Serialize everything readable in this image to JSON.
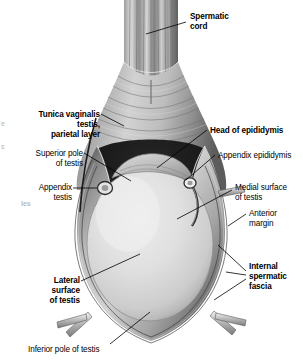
{
  "figure": {
    "background_color": "#ffffff",
    "ink_color": "#000000"
  },
  "labels": [
    {
      "id": "spermatic-cord",
      "text": "Spermatic\ncord",
      "weight": "bold",
      "align": "left",
      "x": 190,
      "y": 12
    },
    {
      "id": "tunica-vaginalis-testis-parietal-layer",
      "text": "Tunica vaginalis\ntestis,\nparietal layer",
      "weight": "bold",
      "align": "right",
      "x": 8,
      "y": 110
    },
    {
      "id": "head-of-epididymis",
      "text": "Head of epididymis",
      "weight": "bold",
      "align": "left",
      "x": 210,
      "y": 126
    },
    {
      "id": "superior-pole-of-testis",
      "text": "Superior pole\nof testis",
      "weight": "normal",
      "align": "right",
      "x": 11,
      "y": 149
    },
    {
      "id": "appendix-epididymis",
      "text": "Appendix epididymis",
      "weight": "normal",
      "align": "left",
      "x": 218,
      "y": 151
    },
    {
      "id": "medial-surface-of-testis",
      "text": "Medial surface\nof testis",
      "weight": "normal",
      "align": "left",
      "x": 235,
      "y": 183
    },
    {
      "id": "appendix-testis",
      "text": "Appendix\ntestis",
      "weight": "normal",
      "align": "right",
      "x": 22,
      "y": 183
    },
    {
      "id": "anterior-margin",
      "text": "Anterior\nmargin",
      "weight": "normal",
      "align": "left",
      "x": 249,
      "y": 209
    },
    {
      "id": "lateral-surface-of-testis",
      "text": "Lateral\nsurface\nof testis",
      "weight": "bold",
      "align": "right",
      "x": 18,
      "y": 276
    },
    {
      "id": "internal-spermatic-fascia",
      "text": "Internal\nspermatic\nfascia",
      "weight": "bold",
      "align": "left",
      "x": 249,
      "y": 262
    },
    {
      "id": "inferior-pole-of-testis",
      "text": "Inferior pole of testis",
      "weight": "normal",
      "align": "left",
      "x": 28,
      "y": 345
    }
  ],
  "artifacts": [
    {
      "id": "margin-artifact-1",
      "text": "e",
      "x": 1,
      "y": 120
    },
    {
      "id": "margin-artifact-2",
      "text": "s",
      "x": 1,
      "y": 143
    },
    {
      "id": "margin-artifact-3",
      "text": "les",
      "x": 21,
      "y": 200
    }
  ],
  "structures": [
    {
      "id": "spermatic-cord-structure",
      "name": "spermatic cord"
    },
    {
      "id": "tunica-vaginalis-structure",
      "name": "tunica vaginalis, parietal layer"
    },
    {
      "id": "testis-body",
      "name": "testis"
    },
    {
      "id": "epididymis-head",
      "name": "head of epididymis"
    },
    {
      "id": "appendix-testis-structure",
      "name": "appendix testis"
    },
    {
      "id": "appendix-epididymis-structure",
      "name": "appendix epididymis"
    },
    {
      "id": "internal-spermatic-fascia-structure",
      "name": "internal spermatic fascia"
    },
    {
      "id": "cut-fascia-edge-left",
      "name": "cut fascial flap, left"
    },
    {
      "id": "cut-fascia-edge-right",
      "name": "cut fascial flap, right"
    }
  ]
}
